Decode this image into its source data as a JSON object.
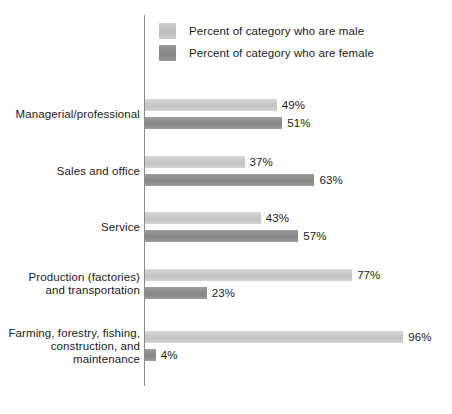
{
  "chart_data": {
    "type": "bar",
    "orientation": "horizontal",
    "title": "",
    "xlabel": "",
    "ylabel": "",
    "xlim": [
      0,
      100
    ],
    "grid": false,
    "legend_position": "top",
    "categories": [
      "Managerial/professional",
      "Sales and office",
      "Service",
      "Production (factories)\nand transportation",
      "Farming, forestry, fishing,\nconstruction, and\nmaintenance"
    ],
    "series": [
      {
        "name": "Percent of category who are male",
        "color": "#c8c8c8",
        "values": [
          49,
          37,
          43,
          77,
          96
        ],
        "labels": [
          "49%",
          "37%",
          "43%",
          "77%",
          "96%"
        ]
      },
      {
        "name": "Percent of category who are female",
        "color": "#8d8d8d",
        "values": [
          51,
          63,
          57,
          23,
          4
        ],
        "labels": [
          "51%",
          "63%",
          "57%",
          "23%",
          "4%"
        ]
      }
    ]
  },
  "legend": {
    "items": [
      {
        "label": "Percent of category who are male",
        "swatch": "male"
      },
      {
        "label": "Percent of category who are female",
        "swatch": "female"
      }
    ]
  },
  "groups": [
    {
      "label_lines": [
        "Managerial/professional"
      ],
      "male_label": "49%",
      "female_label": "51%"
    },
    {
      "label_lines": [
        "Sales and office"
      ],
      "male_label": "37%",
      "female_label": "63%"
    },
    {
      "label_lines": [
        "Service"
      ],
      "male_label": "43%",
      "female_label": "57%"
    },
    {
      "label_lines": [
        "Production (factories)",
        "and transportation"
      ],
      "male_label": "77%",
      "female_label": "23%"
    },
    {
      "label_lines": [
        "Farming, forestry, fishing,",
        "construction, and",
        "maintenance"
      ],
      "male_label": "96%",
      "female_label": "4%"
    }
  ]
}
